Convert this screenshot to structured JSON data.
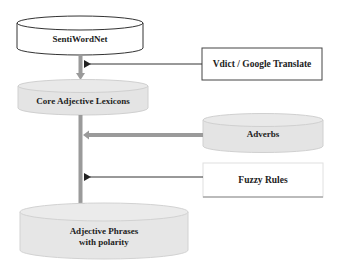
{
  "diagram": {
    "nodes": {
      "sentiwordnet": {
        "label": "SentiWordNet",
        "shape": "cylinder",
        "fill": "#ffffff"
      },
      "vdict": {
        "label": "Vdict / Google Translate",
        "shape": "box",
        "fill": "#ffffff"
      },
      "core": {
        "label": "Core Adjective Lexicons",
        "shape": "cylinder",
        "fill": "#e4e4e4"
      },
      "adverbs": {
        "label": "Adverbs",
        "shape": "cylinder",
        "fill": "#e4e4e4"
      },
      "fuzzy": {
        "label": "Fuzzy Rules",
        "shape": "box",
        "fill": "#ffffff"
      },
      "phrases": {
        "label_line1": "Adjective Phrases",
        "label_line2": "with polarity",
        "shape": "cylinder",
        "fill": "#e8e8e8"
      }
    },
    "edges": [
      {
        "from": "sentiwordnet",
        "to": "core",
        "style": "thick-gray"
      },
      {
        "from": "vdict",
        "to": "sentiwordnet-core-connector",
        "style": "thin-black"
      },
      {
        "from": "core",
        "to": "phrases",
        "style": "thick-gray"
      },
      {
        "from": "adverbs",
        "to": "core-phrases-connector",
        "style": "double-gray"
      },
      {
        "from": "fuzzy",
        "to": "core-phrases-connector",
        "style": "thin-black"
      }
    ],
    "colors": {
      "connector_gray": "#9a9a9a",
      "line_black": "#333333",
      "cylinder_gray": "#e4e4e4"
    }
  }
}
